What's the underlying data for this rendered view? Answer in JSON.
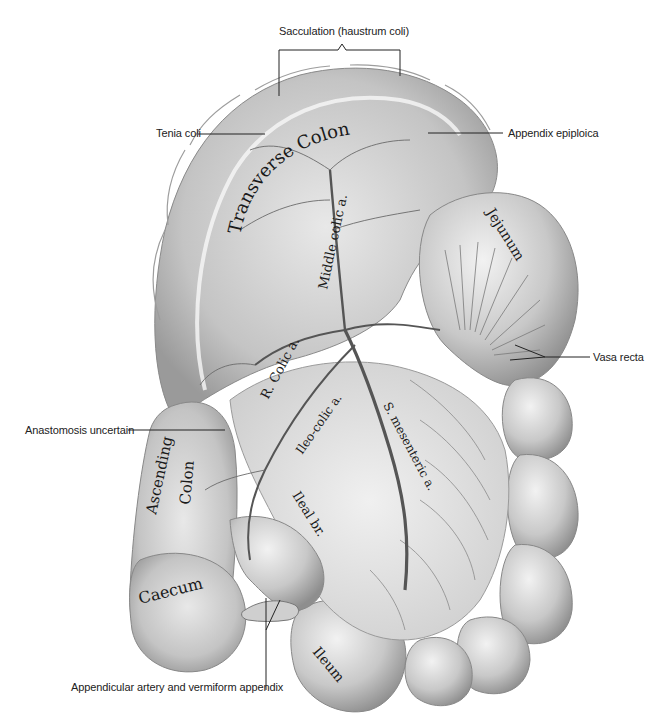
{
  "figure": {
    "palette": {
      "background": "#ffffff",
      "tissue_light": "#e6e6e6",
      "tissue_mid": "#bdbdbd",
      "tissue_dark": "#8a8a8a",
      "vessel": "#555555",
      "ink": "#222222"
    }
  },
  "callouts": {
    "sacculation": "Sacculation (haustrum coli)",
    "tenia_coli": "Tenia coli",
    "appendix_epiploica": "Appendix epiploica",
    "vasa_recta": "Vasa recta",
    "anastomosis": "Anastomosis uncertain",
    "appendicular": "Appendicular artery and vermiform appendix"
  },
  "organ_labels": {
    "transverse_colon": "Transverse Colon",
    "middle_colic": "Middle colic a.",
    "jejunum": "Jejunum",
    "r_colic": "R. Colic a.",
    "ascending_colon_1": "Ascending",
    "ascending_colon_2": "Colon",
    "ileo_colic": "Ileo-colic a.",
    "s_mesenteric": "S. mesenteric a.",
    "ileal_br": "Ileal br.",
    "caecum": "Caecum",
    "ileum": "Ileum"
  }
}
